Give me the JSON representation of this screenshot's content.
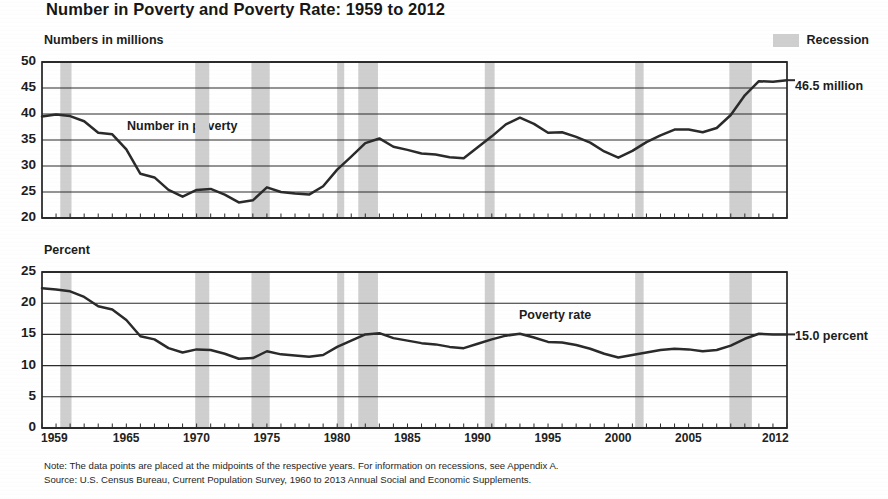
{
  "title": "Number in Poverty and Poverty Rate: 1959 to 2012",
  "legend": {
    "recession_label": "Recession",
    "recession_color": "#cfcfcf"
  },
  "panels": {
    "top": {
      "axis_label": "Numbers in millions",
      "series_name": "Number in poverty",
      "end_label": "46.5 million",
      "yticks": [
        "50",
        "45",
        "40",
        "35",
        "30",
        "25",
        "20"
      ]
    },
    "bottom": {
      "axis_label": "Percent",
      "series_name": "Poverty rate",
      "end_label": "15.0 percent",
      "yticks": [
        "25",
        "20",
        "15",
        "10",
        "5",
        "0"
      ]
    }
  },
  "xticks": [
    "1959",
    "1965",
    "1970",
    "1975",
    "1980",
    "1985",
    "1990",
    "1995",
    "2000",
    "2005",
    "2012"
  ],
  "footnotes": {
    "note": "Note: The data points are placed at the midpoints of the respective years. For information on recessions, see Appendix A.",
    "source": "Source: U.S. Census Bureau, Current Population Survey, 1960 to 2013 Annual Social and Economic Supplements."
  },
  "chart_data": {
    "type": "line",
    "title": "Number in Poverty and Poverty Rate: 1959 to 2012",
    "xlabel": "",
    "grid": true,
    "legend_position": "top-right",
    "xlim": [
      1959,
      2012
    ],
    "x": [
      1959,
      1960,
      1961,
      1962,
      1963,
      1964,
      1965,
      1966,
      1967,
      1968,
      1969,
      1970,
      1971,
      1972,
      1973,
      1974,
      1975,
      1976,
      1977,
      1978,
      1979,
      1980,
      1981,
      1982,
      1983,
      1984,
      1985,
      1986,
      1987,
      1988,
      1989,
      1990,
      1991,
      1992,
      1993,
      1994,
      1995,
      1996,
      1997,
      1998,
      1999,
      2000,
      2001,
      2002,
      2003,
      2004,
      2005,
      2006,
      2007,
      2008,
      2009,
      2010,
      2011,
      2012
    ],
    "panels": [
      {
        "name": "top",
        "ylabel": "Numbers in millions",
        "ylim": [
          20,
          50
        ],
        "yticks": [
          20,
          25,
          30,
          35,
          40,
          45,
          50
        ],
        "series": [
          {
            "name": "Number in poverty",
            "units": "millions",
            "end_value": 46.5,
            "values": [
              39.5,
              39.9,
              39.6,
              38.6,
              36.4,
              36.1,
              33.2,
              28.5,
              27.8,
              25.4,
              24.1,
              25.4,
              25.6,
              24.5,
              23.0,
              23.4,
              25.9,
              25.0,
              24.7,
              24.5,
              26.1,
              29.3,
              31.8,
              34.4,
              35.3,
              33.7,
              33.1,
              32.4,
              32.2,
              31.7,
              31.5,
              33.6,
              35.7,
              38.0,
              39.3,
              38.1,
              36.4,
              36.5,
              35.6,
              34.5,
              32.8,
              31.6,
              32.9,
              34.6,
              35.9,
              37.0,
              37.0,
              36.5,
              37.3,
              39.8,
              43.6,
              46.3,
              46.2,
              46.5
            ]
          }
        ]
      },
      {
        "name": "bottom",
        "ylabel": "Percent",
        "ylim": [
          0,
          25
        ],
        "yticks": [
          0,
          5,
          10,
          15,
          20,
          25
        ],
        "series": [
          {
            "name": "Poverty rate",
            "units": "percent",
            "end_value": 15.0,
            "values": [
              22.4,
              22.2,
              21.9,
              21.0,
              19.5,
              19.0,
              17.3,
              14.7,
              14.2,
              12.8,
              12.1,
              12.6,
              12.5,
              11.9,
              11.1,
              11.2,
              12.3,
              11.8,
              11.6,
              11.4,
              11.7,
              13.0,
              14.0,
              15.0,
              15.2,
              14.4,
              14.0,
              13.6,
              13.4,
              13.0,
              12.8,
              13.5,
              14.2,
              14.8,
              15.1,
              14.5,
              13.8,
              13.7,
              13.3,
              12.7,
              11.9,
              11.3,
              11.7,
              12.1,
              12.5,
              12.7,
              12.6,
              12.3,
              12.5,
              13.2,
              14.3,
              15.1,
              15.0,
              15.0
            ]
          }
        ]
      }
    ],
    "recessions": [
      {
        "start": 1960.3,
        "end": 1961.1
      },
      {
        "start": 1969.9,
        "end": 1970.9
      },
      {
        "start": 1973.9,
        "end": 1975.2
      },
      {
        "start": 1980.0,
        "end": 1980.5
      },
      {
        "start": 1981.5,
        "end": 1982.9
      },
      {
        "start": 1990.5,
        "end": 1991.2
      },
      {
        "start": 2001.2,
        "end": 2001.8
      },
      {
        "start": 2007.9,
        "end": 2009.5
      }
    ]
  }
}
